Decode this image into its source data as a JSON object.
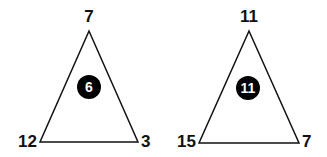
{
  "puzzle": {
    "triangles": [
      {
        "top": "7",
        "left": "12",
        "right": "3",
        "center": "6"
      },
      {
        "top": "11",
        "left": "15",
        "right": "7",
        "center": "11"
      }
    ]
  },
  "colors": {
    "stroke": "#111111",
    "circle": "#000000",
    "center_text": "#ffffff",
    "background": "#ffffff"
  }
}
